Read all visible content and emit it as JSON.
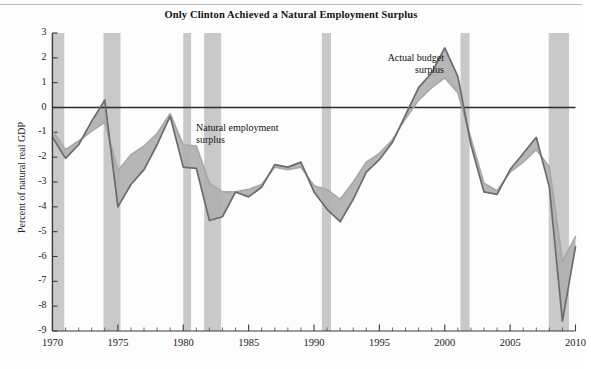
{
  "chart_data": {
    "type": "line",
    "title": "Only Clinton Achieved a Natural Employment Surplus",
    "xlabel": "",
    "ylabel": "Percent of natural real GDP",
    "xlim": [
      1970,
      2010
    ],
    "ylim": [
      -9,
      3
    ],
    "grid": false,
    "legend_position": "inline-annotations",
    "yticks": [
      3,
      2,
      1,
      0,
      -1,
      -2,
      -3,
      -4,
      -5,
      -6,
      -7,
      -8,
      -9
    ],
    "ytick_labels": [
      "3",
      "2",
      "1",
      "0",
      "-1",
      "-2",
      "-3",
      "-4",
      "-5",
      "-6",
      "-7",
      "-8",
      "-9"
    ],
    "xticks": [
      1970,
      1975,
      1980,
      1985,
      1990,
      1995,
      2000,
      2005,
      2010
    ],
    "xtick_labels": [
      "1970",
      "1975",
      "1980",
      "1985",
      "1990",
      "1995",
      "2000",
      "2005",
      "2010"
    ],
    "xminor_tick_step": 1,
    "zero_line": 0,
    "x": [
      1970,
      1971,
      1972,
      1973,
      1974,
      1975,
      1976,
      1977,
      1978,
      1979,
      1980,
      1981,
      1982,
      1983,
      1984,
      1985,
      1986,
      1987,
      1988,
      1989,
      1990,
      1991,
      1992,
      1993,
      1994,
      1995,
      1996,
      1997,
      1998,
      1999,
      2000,
      2001,
      2002,
      2003,
      2004,
      2005,
      2006,
      2007,
      2008,
      2009,
      2010
    ],
    "series": [
      {
        "name": "Actual budget surplus",
        "color": "#6b6b6b",
        "values": [
          -1.2,
          -2.05,
          -1.5,
          -0.55,
          0.3,
          -4.0,
          -3.1,
          -2.5,
          -1.5,
          -0.35,
          -2.4,
          -2.45,
          -4.55,
          -4.4,
          -3.4,
          -3.6,
          -3.2,
          -2.3,
          -2.4,
          -2.2,
          -3.4,
          -4.1,
          -4.6,
          -3.7,
          -2.6,
          -2.1,
          -1.4,
          -0.3,
          0.8,
          1.4,
          2.4,
          1.25,
          -1.5,
          -3.4,
          -3.5,
          -2.5,
          -1.85,
          -1.2,
          -3.2,
          -8.6,
          -5.6
        ]
      },
      {
        "name": "Natural employment surplus",
        "color": "#a8a8a8",
        "values": [
          -0.95,
          -1.7,
          -1.35,
          -0.95,
          -0.6,
          -2.55,
          -1.9,
          -1.55,
          -1.05,
          -0.25,
          -1.5,
          -1.55,
          -3.05,
          -3.4,
          -3.4,
          -3.3,
          -3.1,
          -2.4,
          -2.5,
          -2.4,
          -3.15,
          -3.3,
          -3.7,
          -3.0,
          -2.2,
          -1.85,
          -1.3,
          -0.45,
          0.3,
          0.8,
          1.2,
          0.6,
          -1.25,
          -3.05,
          -3.35,
          -2.6,
          -2.2,
          -1.7,
          -2.4,
          -6.2,
          -5.2
        ]
      }
    ],
    "fill_between": {
      "between": [
        "Actual budget surplus",
        "Natural employment surplus"
      ],
      "color": "#b0b0b0"
    },
    "recession_bands": {
      "color": "#c9c9c9",
      "ranges": [
        [
          1969.9,
          1970.9
        ],
        [
          1973.9,
          1975.2
        ],
        [
          1980.0,
          1980.6
        ],
        [
          1981.6,
          1982.9
        ],
        [
          1990.6,
          1991.3
        ],
        [
          2001.2,
          2001.9
        ],
        [
          2007.95,
          2009.5
        ]
      ]
    },
    "annotations": [
      {
        "text": "Natural employment\nsurplus",
        "x": 1983.0,
        "y": -1.0,
        "align": "left"
      },
      {
        "text": "Actual budget\nsurplus",
        "x": 1998.0,
        "y": 2.1,
        "align": "right"
      }
    ]
  },
  "axes": {
    "ylabel": "Percent of natural real GDP",
    "ytick_labels": [
      "3",
      "2",
      "1",
      "0",
      "-1",
      "-2",
      "-3",
      "-4",
      "-5",
      "-6",
      "-7",
      "-8",
      "-9"
    ],
    "xtick_labels": [
      "1970",
      "1975",
      "1980",
      "1985",
      "1990",
      "1995",
      "2000",
      "2005",
      "2010"
    ]
  },
  "annotations": {
    "natural": "Natural employment\nsurplus",
    "actual": "Actual budget\nsurplus"
  },
  "colors": {
    "actual_line": "#6b6b6b",
    "natural_line": "#a8a8a8",
    "fill": "#b0b0b0",
    "recession": "#c9c9c9",
    "axis": "#3a3a3a",
    "background": "#fdfdfd"
  }
}
